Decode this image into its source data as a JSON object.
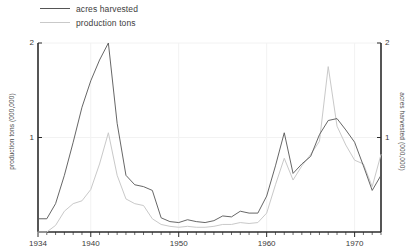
{
  "chart_data": {
    "type": "line",
    "title": "",
    "xlabel": "",
    "ylabel": "production tons (000,000)",
    "y2label": "acres harvested (000,000)",
    "xlim": [
      1934,
      1973
    ],
    "ylim": [
      0,
      2
    ],
    "y2lim": [
      0,
      2
    ],
    "grid": true,
    "legend_position": "top-left",
    "y_ticks": [
      "0",
      "1",
      "2"
    ],
    "y_tick_values": [
      0,
      1,
      2
    ],
    "y2_ticks": [
      "0",
      "1",
      "2"
    ],
    "y2_tick_values": [
      0,
      1,
      2
    ],
    "x_ticks": [
      "1934",
      "1940",
      "1950",
      "1960",
      "1970"
    ],
    "x_tick_values": [
      1934,
      1940,
      1950,
      1960,
      1970
    ],
    "x_minor_tick_step": 1,
    "x": [
      1934,
      1935,
      1936,
      1937,
      1938,
      1939,
      1940,
      1941,
      1942,
      1943,
      1944,
      1945,
      1946,
      1947,
      1948,
      1949,
      1950,
      1951,
      1952,
      1953,
      1954,
      1955,
      1956,
      1957,
      1958,
      1959,
      1960,
      1961,
      1962,
      1963,
      1964,
      1965,
      1966,
      1967,
      1968,
      1969,
      1970,
      1971,
      1972,
      1973
    ],
    "series": [
      {
        "name": "acres harvested",
        "color": "#555555",
        "axis": "right",
        "values": [
          0.14,
          0.14,
          0.3,
          0.6,
          0.95,
          1.32,
          1.6,
          1.82,
          2.0,
          1.15,
          0.6,
          0.5,
          0.48,
          0.44,
          0.15,
          0.11,
          0.1,
          0.13,
          0.11,
          0.1,
          0.12,
          0.17,
          0.16,
          0.22,
          0.2,
          0.2,
          0.38,
          0.7,
          1.05,
          0.62,
          0.72,
          0.8,
          1.03,
          1.18,
          1.2,
          1.08,
          0.95,
          0.7,
          0.44,
          0.6
        ]
      },
      {
        "name": "production tons",
        "color": "#c9c9c9",
        "axis": "left",
        "values": [
          0.0,
          0.0,
          0.07,
          0.22,
          0.3,
          0.33,
          0.45,
          0.72,
          1.05,
          0.6,
          0.35,
          0.3,
          0.28,
          0.14,
          0.08,
          0.06,
          0.05,
          0.06,
          0.05,
          0.05,
          0.06,
          0.08,
          0.08,
          0.1,
          0.09,
          0.1,
          0.2,
          0.5,
          0.78,
          0.55,
          0.7,
          0.82,
          0.96,
          1.75,
          1.12,
          0.92,
          0.76,
          0.72,
          0.48,
          0.82
        ]
      }
    ]
  },
  "legend": {
    "items": [
      {
        "label": "acres harvested"
      },
      {
        "label": "production tons"
      }
    ]
  },
  "axes": {
    "left_title": "production tons (000,000)",
    "right_title": "acres harvested (000,000)",
    "left_ticks": [
      "2",
      "1"
    ],
    "right_ticks": [
      "2",
      "1"
    ],
    "x_labels": [
      "1934",
      "1940",
      "1950",
      "1960",
      "1970"
    ]
  },
  "colors": {
    "acres_line": "#555555",
    "production_line": "#c9c9c9",
    "axis": "#2b2b2b",
    "grid": "#f2f2f2",
    "text": "#3a3a3a"
  }
}
